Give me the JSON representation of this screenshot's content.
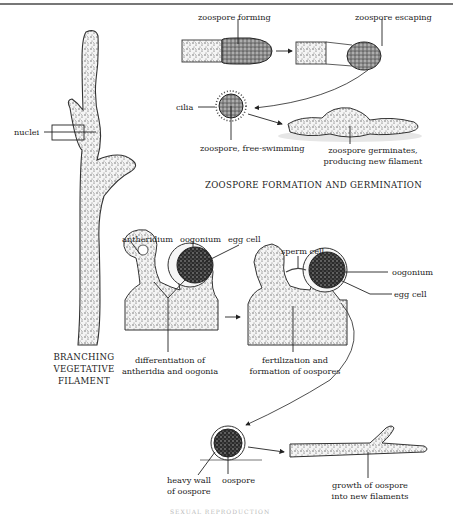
{
  "diagram": {
    "sections": [
      {
        "id": "vegetative",
        "title_lines": [
          "BRANCHING",
          "VEGETATIVE",
          "FILAMENT"
        ],
        "labels": [
          "nuclei"
        ]
      },
      {
        "id": "asexual",
        "title": "ZOOSPORE FORMATION AND GERMINATION",
        "labels": [
          "zoospore forming",
          "zoospore escaping",
          "cilia",
          "zoospore, free-swimming",
          "zoospore germinates,",
          "producing new filament"
        ]
      },
      {
        "id": "sexual",
        "labels": [
          "antheridium",
          "oogonium",
          "egg cell",
          "sperm cell",
          "oogonium",
          "egg cell",
          "differentiation of",
          "antheridia and oogonia",
          "fertilization and",
          "formation of oospores",
          "heavy wall",
          "of  oospore",
          "oospore",
          "growth of oospore",
          "into new filaments"
        ]
      }
    ]
  },
  "labels": {
    "nuclei": "nuclei",
    "zoospore_forming": "zoospore forming",
    "zoospore_escaping": "zoospore escaping",
    "cilia": "cilia",
    "free_swimming": "zoospore, free-swimming",
    "germinates_1": "zoospore germinates,",
    "germinates_2": "producing new filament",
    "asexual_title": "ZOOSPORE FORMATION AND GERMINATION",
    "branching_1": "BRANCHING",
    "branching_2": "VEGETATIVE",
    "branching_3": "FILAMENT",
    "antheridium": "antheridium",
    "oogonium_1": "oogonium",
    "egg_cell_1": "egg cell",
    "sperm_cell": "sperm cell",
    "oogonium_2": "oogonium",
    "egg_cell_2": "egg cell",
    "diff_1": "differentiation of",
    "diff_2": "antheridia and oogonia",
    "fert_1": "fertilization and",
    "fert_2": "formation of oospores",
    "heavy_wall_1": "heavy wall",
    "heavy_wall_2": "of  oospore",
    "oospore": "oospore",
    "growth_1": "growth of oospore",
    "growth_2": "into new filaments",
    "bottom_caption_cut": "SEXUAL REPRODUCTION"
  },
  "colors": {
    "ink": "#222222",
    "stipple": "#555555",
    "background": "#ffffff"
  }
}
